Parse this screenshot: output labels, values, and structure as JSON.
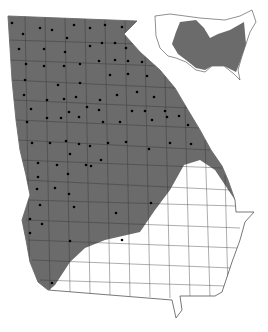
{
  "map": {
    "region": "Georgia",
    "inset_region": "Contiguous United States",
    "colors": {
      "range_fill": "#6b6b6b",
      "county_line": "#333333",
      "outline_white_region": "#555555",
      "background": "#ffffff",
      "dot": "#000000"
    },
    "legend": {
      "shaded": "Species range",
      "dot": "County record"
    },
    "dots": [
      [
        12,
        23
      ],
      [
        23,
        34
      ],
      [
        40,
        28
      ],
      [
        52,
        30
      ],
      [
        74,
        25
      ],
      [
        90,
        28
      ],
      [
        105,
        25
      ],
      [
        122,
        27
      ],
      [
        19,
        49
      ],
      [
        44,
        49
      ],
      [
        67,
        38
      ],
      [
        65,
        52
      ],
      [
        90,
        46
      ],
      [
        102,
        43
      ],
      [
        115,
        43
      ],
      [
        126,
        48
      ],
      [
        26,
        64
      ],
      [
        44,
        66
      ],
      [
        64,
        66
      ],
      [
        80,
        64
      ],
      [
        99,
        61
      ],
      [
        115,
        60
      ],
      [
        128,
        61
      ],
      [
        142,
        62
      ],
      [
        25,
        80
      ],
      [
        58,
        85
      ],
      [
        80,
        83
      ],
      [
        110,
        75
      ],
      [
        128,
        74
      ],
      [
        147,
        76
      ],
      [
        24,
        95
      ],
      [
        47,
        100
      ],
      [
        64,
        99
      ],
      [
        76,
        97
      ],
      [
        87,
        107
      ],
      [
        100,
        100
      ],
      [
        117,
        95
      ],
      [
        137,
        92
      ],
      [
        154,
        97
      ],
      [
        31,
        109
      ],
      [
        47,
        118
      ],
      [
        69,
        112
      ],
      [
        87,
        108
      ],
      [
        99,
        110
      ],
      [
        132,
        111
      ],
      [
        145,
        111
      ],
      [
        165,
        111
      ],
      [
        179,
        116
      ],
      [
        27,
        122
      ],
      [
        61,
        118
      ],
      [
        79,
        117
      ],
      [
        103,
        122
      ],
      [
        120,
        122
      ],
      [
        152,
        120
      ],
      [
        167,
        117
      ],
      [
        188,
        125
      ],
      [
        32,
        143
      ],
      [
        50,
        143
      ],
      [
        66,
        141
      ],
      [
        79,
        144
      ],
      [
        90,
        146
      ],
      [
        108,
        143
      ],
      [
        126,
        142
      ],
      [
        170,
        143
      ],
      [
        191,
        144
      ],
      [
        38,
        163
      ],
      [
        57,
        165
      ],
      [
        70,
        154
      ],
      [
        86,
        165
      ],
      [
        101,
        160
      ],
      [
        149,
        149
      ],
      [
        38,
        177
      ],
      [
        68,
        174
      ],
      [
        91,
        166
      ],
      [
        37,
        189
      ],
      [
        55,
        188
      ],
      [
        69,
        194
      ],
      [
        40,
        205
      ],
      [
        74,
        207
      ],
      [
        116,
        213
      ],
      [
        151,
        203
      ],
      [
        30,
        219
      ],
      [
        42,
        224
      ],
      [
        30,
        233
      ],
      [
        70,
        241
      ],
      [
        122,
        240
      ],
      [
        52,
        283
      ]
    ]
  }
}
